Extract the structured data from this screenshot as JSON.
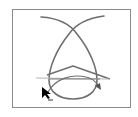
{
  "diagram": {
    "elements": [
      {
        "name": "loop-path",
        "kind": "curve"
      },
      {
        "name": "chevron-shape",
        "kind": "polyline"
      },
      {
        "name": "baseline",
        "kind": "line"
      },
      {
        "name": "direction-arrow",
        "kind": "curved-arrow"
      },
      {
        "name": "mouse-pointer",
        "kind": "cursor"
      }
    ],
    "colors": {
      "frame": "#8a8a8a",
      "stroke": "#6f6f6f",
      "light_stroke": "#b5b5b5",
      "cursor": "#000000",
      "background": "#ffffff"
    }
  }
}
